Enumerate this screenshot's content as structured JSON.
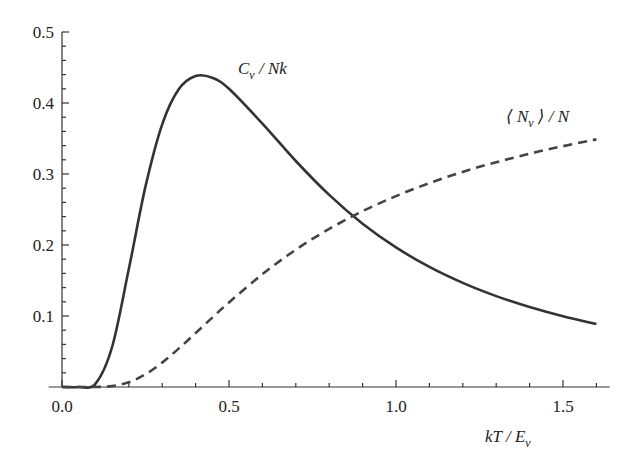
{
  "chart_data": {
    "type": "line",
    "title": "",
    "xlabel": "kT / E_v",
    "ylabel": "",
    "xlim": [
      -0.04,
      1.64
    ],
    "ylim": [
      0,
      0.5
    ],
    "grid": false,
    "legend": "inline labels",
    "x_ticks": [
      "0.0",
      "0.5",
      "1.0",
      "1.5"
    ],
    "y_ticks": [
      "0.1",
      "0.2",
      "0.3",
      "0.4",
      "0.5"
    ],
    "x": [
      0.0,
      0.05,
      0.1,
      0.15,
      0.2,
      0.25,
      0.3,
      0.35,
      0.4,
      0.45,
      0.5,
      0.6,
      0.7,
      0.8,
      0.9,
      1.0,
      1.1,
      1.2,
      1.3,
      1.4,
      1.5,
      1.6
    ],
    "series": [
      {
        "name": "C_v / Nk",
        "style": "solid",
        "color": "#333333",
        "values": [
          0.0,
          0.0,
          0.0045,
          0.0563,
          0.166,
          0.2825,
          0.37,
          0.4196,
          0.438,
          0.4356,
          0.42,
          0.371,
          0.3183,
          0.2705,
          0.23,
          0.1966,
          0.1692,
          0.1466,
          0.128,
          0.1126,
          0.0996,
          0.0887
        ]
      },
      {
        "name": "⟨N_v⟩ / N",
        "style": "dashed",
        "color": "#444444",
        "values": [
          0.0,
          0.0,
          5e-05,
          0.00127,
          0.00669,
          0.018,
          0.0344,
          0.0543,
          0.0759,
          0.0978,
          0.1192,
          0.1589,
          0.1934,
          0.2227,
          0.2477,
          0.2689,
          0.2872,
          0.303,
          0.3166,
          0.3286,
          0.3392,
          0.3487
        ]
      }
    ],
    "annotations": [
      {
        "text": "C_v / Nk",
        "near_x": 0.72,
        "near_y": 0.46
      },
      {
        "text": "⟨N_v⟩ / N",
        "near_x": 1.42,
        "near_y": 0.38
      }
    ]
  },
  "labels": {
    "cv_main": "C",
    "cv_sub": "v",
    "cv_rest": " / Nk",
    "n_open": "⟨ N",
    "n_sub": "v",
    "n_rest": " ⟩ / N",
    "x_main": "kT / E",
    "x_sub": "v"
  }
}
